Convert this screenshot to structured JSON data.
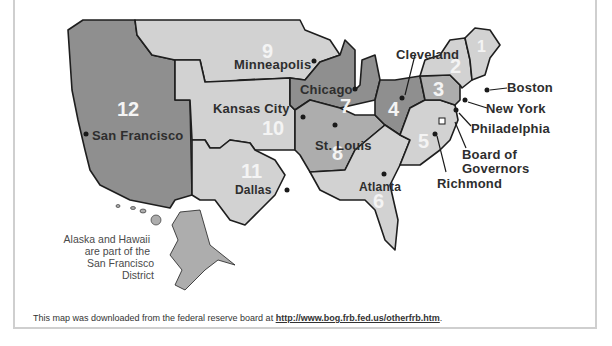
{
  "map": {
    "title_cut": "",
    "districts": [
      {
        "number": "1",
        "city": "Boston"
      },
      {
        "number": "2",
        "city": "New York"
      },
      {
        "number": "3",
        "city": "Philadelphia"
      },
      {
        "number": "4",
        "city": "Cleveland"
      },
      {
        "number": "5",
        "city": "Richmond"
      },
      {
        "number": "6",
        "city": "Atlanta"
      },
      {
        "number": "7",
        "city": "Chicago"
      },
      {
        "number": "8",
        "city": "St. Louis"
      },
      {
        "number": "9",
        "city": "Minneapolis"
      },
      {
        "number": "10",
        "city": "Kansas City"
      },
      {
        "number": "11",
        "city": "Dallas"
      },
      {
        "number": "12",
        "city": "San Francisco"
      }
    ],
    "board_label_line1": "Board of",
    "board_label_line2": "Governors",
    "note_line1": "Alaska and Hawaii",
    "note_line2": "are part of the",
    "note_line3": "San Francisco District",
    "colors": {
      "dark": "#8f8f8f",
      "medium": "#adadad",
      "light": "#d2d2d2",
      "border": "#1e1e1e"
    }
  },
  "caption": {
    "text": "This map was downloaded from the federal reserve board at ",
    "link": "http://www.bog.frb.fed.us/otherfrb.htm",
    "end": "."
  }
}
